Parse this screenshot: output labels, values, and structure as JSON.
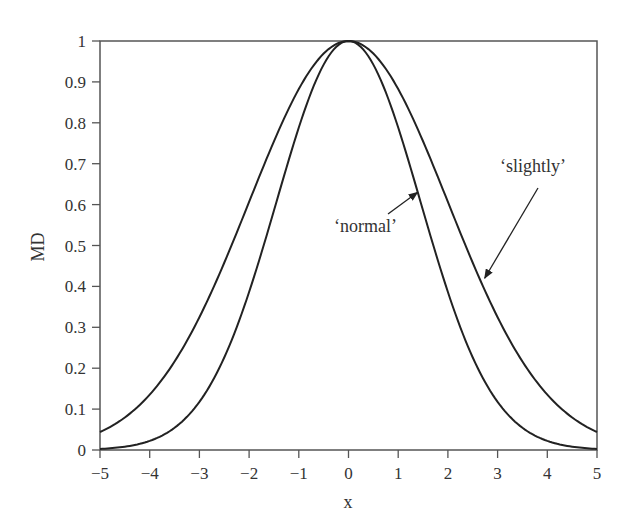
{
  "chart_data": {
    "type": "line",
    "title": "",
    "xlabel": "x",
    "ylabel": "MD",
    "xlim": [
      -5,
      5
    ],
    "ylim": [
      0,
      1
    ],
    "grid": false,
    "legend": "none (curves labelled by annotation arrows)",
    "x_ticks": [
      -5,
      -4,
      -3,
      -2,
      -1,
      0,
      1,
      2,
      3,
      4,
      5
    ],
    "x_tick_labels": [
      "−5",
      "−4",
      "−3",
      "−2",
      "−1",
      "0",
      "1",
      "2",
      "3",
      "4",
      "5"
    ],
    "y_ticks": [
      0,
      0.1,
      0.2,
      0.3,
      0.4,
      0.5,
      0.6,
      0.7,
      0.8,
      0.9,
      1
    ],
    "y_tick_labels": [
      "0",
      "0.1",
      "0.2",
      "0.3",
      "0.4",
      "0.5",
      "0.6",
      "0.7",
      "0.8",
      "0.9",
      "1"
    ],
    "x": [
      -5,
      -4,
      -3,
      -2,
      -1,
      0,
      1,
      2,
      3,
      4,
      5
    ],
    "series": [
      {
        "name": "'normal'",
        "shape": "gaussian",
        "center": 0,
        "sigma": 1.45,
        "values": [
          0.003,
          0.022,
          0.118,
          0.386,
          0.788,
          1.0,
          0.788,
          0.386,
          0.118,
          0.022,
          0.003
        ]
      },
      {
        "name": "'slightly'",
        "shape": "gaussian",
        "center": 0,
        "sigma": 2.0,
        "values": [
          0.044,
          0.135,
          0.325,
          0.607,
          0.882,
          1.0,
          0.882,
          0.607,
          0.325,
          0.135,
          0.044
        ]
      }
    ],
    "annotations": [
      {
        "text": "‘normal’",
        "arrow_to": {
          "x": 1.35,
          "y": 0.63
        }
      },
      {
        "text": "‘slightly’",
        "arrow_to": {
          "x": 2.7,
          "y": 0.42
        }
      }
    ]
  },
  "style": {
    "line_color": "#222222",
    "axis_color": "#555555",
    "text_color": "#333333"
  }
}
